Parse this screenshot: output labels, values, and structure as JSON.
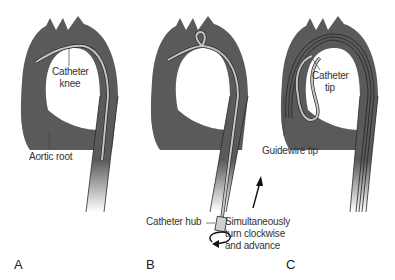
{
  "figure": {
    "colors": {
      "aorta": "#5a5a5a",
      "catheter": "#bdbdbd",
      "outline": "#2a2a2a",
      "text": "#333333",
      "background": "#ffffff"
    },
    "panels": [
      {
        "letter": "A",
        "labels": {
          "catheter_knee_line1": "Catheter",
          "catheter_knee_line2": "knee",
          "aortic_root": "Aortic root"
        }
      },
      {
        "letter": "B",
        "labels": {
          "catheter_hub": "Catheter hub",
          "instruction_line1": "Simultaneously",
          "instruction_line2": "turn clockwise",
          "instruction_line3": "and advance"
        },
        "icons": [
          "up-arrow-icon",
          "clockwise-rotation-arrow-icon"
        ]
      },
      {
        "letter": "C",
        "labels": {
          "catheter_tip_line1": "Catheter",
          "catheter_tip_line2": "tip",
          "guidewire_tip": "Guidewire tip"
        }
      }
    ]
  }
}
